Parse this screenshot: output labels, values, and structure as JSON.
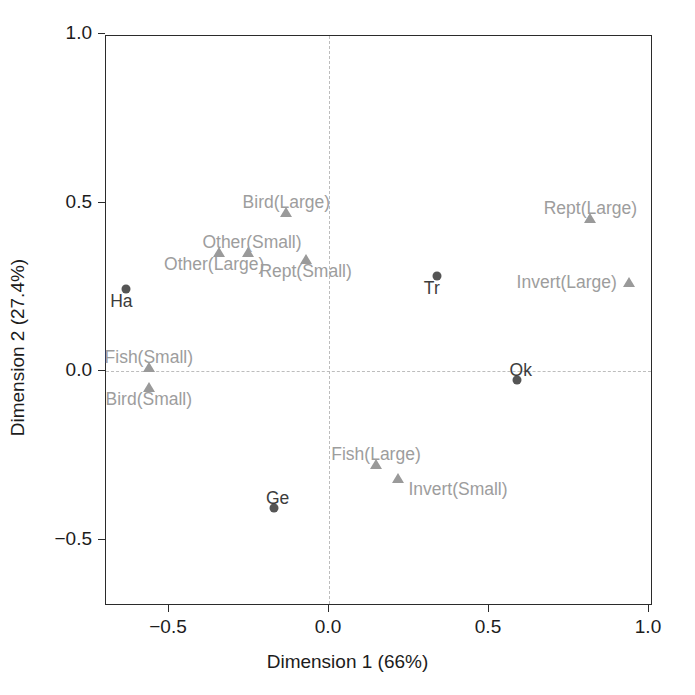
{
  "chart_data": {
    "type": "scatter",
    "title": "",
    "xlabel": "Dimension 1 (66%)",
    "ylabel": "Dimension 2 (27.4%)",
    "xlim": [
      -0.7,
      1.02
    ],
    "ylim": [
      -0.68,
      1.0
    ],
    "xticks": [
      -0.5,
      0.0,
      0.5,
      1.0
    ],
    "xticklabels": [
      "−0.5",
      "0.0",
      "0.5",
      "1.0"
    ],
    "yticks": [
      -0.5,
      0.0,
      0.5,
      1.0
    ],
    "yticklabels": [
      "−0.5",
      "0.0",
      "0.5",
      "1.0"
    ],
    "grid": false,
    "reference_lines": {
      "x": 0.0,
      "y": 0.0,
      "style": "dashed",
      "color": "#bdbdbd"
    },
    "legend": "none",
    "colors": {
      "circle_marker": "#555555",
      "triangle_marker": "#9a9a9a",
      "category_label": "#9d9d9d",
      "site_label": "#3c3c3c",
      "axis": "#2b2b2b"
    },
    "series": [
      {
        "name": "Sites",
        "marker": "circle",
        "color": "#555555",
        "label_color": "#3c3c3c",
        "points": [
          {
            "label": "Ha",
            "x": -0.63,
            "y": 0.24,
            "label_pos": "below-left"
          },
          {
            "label": "Tr",
            "x": 0.34,
            "y": 0.28,
            "label_pos": "below-left"
          },
          {
            "label": "Ok",
            "x": 0.59,
            "y": -0.03,
            "label_pos": "above-right"
          },
          {
            "label": "Ge",
            "x": -0.17,
            "y": -0.41,
            "label_pos": "above-right"
          }
        ]
      },
      {
        "name": "Prey categories",
        "marker": "triangle",
        "color": "#9a9a9a",
        "label_color": "#9d9d9d",
        "points": [
          {
            "label": "Bird(Large)",
            "x": -0.13,
            "y": 0.47,
            "label_pos": "above"
          },
          {
            "label": "Other(Small)",
            "x": -0.25,
            "y": 0.35,
            "label_pos": "above-right"
          },
          {
            "label": "Other(Large)",
            "x": -0.34,
            "y": 0.35,
            "label_pos": "below-left"
          },
          {
            "label": "Rept(Small)",
            "x": -0.07,
            "y": 0.33,
            "label_pos": "below"
          },
          {
            "label": "Rept(Large)",
            "x": 0.82,
            "y": 0.45,
            "label_pos": "above"
          },
          {
            "label": "Invert(Large)",
            "x": 0.94,
            "y": 0.26,
            "label_pos": "left"
          },
          {
            "label": "Fish(Small)",
            "x": -0.56,
            "y": 0.01,
            "label_pos": "above"
          },
          {
            "label": "Bird(Small)",
            "x": -0.56,
            "y": -0.05,
            "label_pos": "below"
          },
          {
            "label": "Fish(Large)",
            "x": 0.15,
            "y": -0.28,
            "label_pos": "above"
          },
          {
            "label": "Invert(Small)",
            "x": 0.22,
            "y": -0.32,
            "label_pos": "below-right"
          }
        ]
      }
    ]
  }
}
